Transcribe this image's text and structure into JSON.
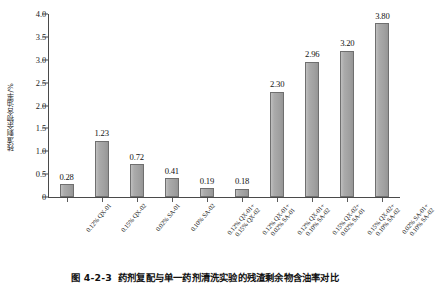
{
  "figure": {
    "caption_number": "图 4-2-3",
    "caption_text": "药剂复配与单一药剂清洗实验的残渣剩余物含油率对比"
  },
  "chart_data": {
    "type": "bar",
    "title": "",
    "xlabel": "",
    "ylabel": "残渣剩余物含油率/%",
    "ylim": [
      0,
      4.0
    ],
    "yticks": [
      "0",
      "0.5",
      "1.0",
      "1.5",
      "2.0",
      "2.5",
      "3.0",
      "3.5",
      "4.0"
    ],
    "ytick_values": [
      0,
      0.5,
      1.0,
      1.5,
      2.0,
      2.5,
      3.0,
      3.5,
      4.0
    ],
    "grid": false,
    "legend": "none",
    "bar_color": "#a6a6a6",
    "bar_edge_color": "#6f6f6f",
    "categories": [
      "0.12% QX-01",
      "0.15% QX-02",
      "0.02% SA-01",
      "0.10% SA-02",
      "0.12% QX-01+\n0.15% QX-02",
      "0.12% QX-01+\n0.02% SA-01",
      "0.12% QX-01+\n0.10% SA-02",
      "0.15% QX-02+\n0.02% SA-01",
      "0.15% QX-02+\n0.10% SA-02",
      "0.02% SA-01+\n0.10% SA-02"
    ],
    "category_lines": [
      [
        "0.12% QX-01",
        ""
      ],
      [
        "0.15% QX-02",
        ""
      ],
      [
        "0.02% SA-01",
        ""
      ],
      [
        "0.10% SA-02",
        ""
      ],
      [
        "0.12% QX-01+",
        "0.15% QX-02"
      ],
      [
        "0.12% QX-01+",
        "0.02% SA-01"
      ],
      [
        "0.12% QX-01+",
        "0.10% SA-02"
      ],
      [
        "0.15% QX-02+",
        "0.02% SA-01"
      ],
      [
        "0.15% QX-02+",
        "0.10% SA-02"
      ],
      [
        "0.02% SA-01+",
        "0.10% SA-02"
      ]
    ],
    "values": [
      0.28,
      1.23,
      0.72,
      0.41,
      0.19,
      0.18,
      2.3,
      2.96,
      3.2,
      3.8
    ],
    "value_labels": [
      "0.28",
      "1.23",
      "0.72",
      "0.41",
      "0.19",
      "0.18",
      "2.30",
      "2.96",
      "3.20",
      "3.80"
    ]
  }
}
